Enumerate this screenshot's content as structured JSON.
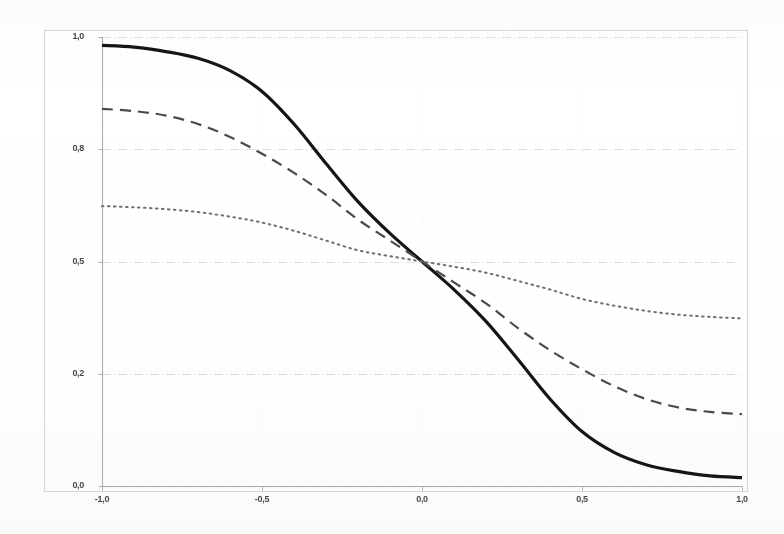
{
  "chart_data": {
    "type": "line",
    "title": "",
    "xlabel": "",
    "ylabel": "",
    "xlim": [
      -1.0,
      1.0
    ],
    "ylim": [
      0.0,
      1.0
    ],
    "grid": true,
    "legend": "none",
    "x_ticks": [
      "-1,0",
      "-0,5",
      "0,0",
      "0,5",
      "1,0"
    ],
    "x_tick_values": [
      -1.0,
      -0.5,
      0.0,
      0.5,
      1.0
    ],
    "y_ticks": [
      "1,0",
      "0,8",
      "0,5",
      "0,2",
      "0,0"
    ],
    "y_tick_values": [
      1.0,
      0.8,
      0.5,
      0.2,
      0.0
    ],
    "x": [
      -1.0,
      -0.9,
      -0.8,
      -0.7,
      -0.6,
      -0.5,
      -0.4,
      -0.3,
      -0.2,
      -0.1,
      0.0,
      0.1,
      0.2,
      0.3,
      0.4,
      0.5,
      0.6,
      0.7,
      0.8,
      0.9,
      1.0
    ],
    "series": [
      {
        "name": "steep-sigmoid",
        "style": "solid",
        "color": "#151515",
        "width": 3.2,
        "values": [
          0.985,
          0.982,
          0.974,
          0.962,
          0.94,
          0.903,
          0.845,
          0.762,
          0.66,
          0.575,
          0.5,
          0.425,
          0.34,
          0.238,
          0.155,
          0.097,
          0.06,
          0.038,
          0.026,
          0.018,
          0.015
        ]
      },
      {
        "name": "medium-sigmoid",
        "style": "dashed",
        "color": "#4a4a4a",
        "width": 2.2,
        "values": [
          0.872,
          0.868,
          0.86,
          0.845,
          0.822,
          0.788,
          0.737,
          0.678,
          0.612,
          0.556,
          0.5,
          0.444,
          0.388,
          0.322,
          0.263,
          0.212,
          0.178,
          0.155,
          0.14,
          0.132,
          0.128
        ]
      },
      {
        "name": "shallow-sigmoid",
        "style": "dotted",
        "color": "#707070",
        "width": 2.0,
        "values": [
          0.648,
          0.645,
          0.64,
          0.632,
          0.62,
          0.604,
          0.582,
          0.556,
          0.53,
          0.514,
          0.5,
          0.486,
          0.47,
          0.448,
          0.425,
          0.4,
          0.382,
          0.368,
          0.358,
          0.352,
          0.348
        ]
      }
    ],
    "axis_color": "#9a9a9a",
    "grid_color": "#c9d3dc",
    "frame_color": "#b8b8b8"
  }
}
